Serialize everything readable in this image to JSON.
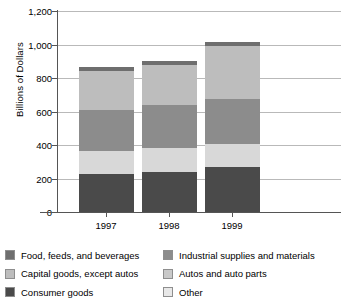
{
  "chart_data": {
    "type": "bar",
    "subtype": "stacked-vertical",
    "title": "",
    "xlabel": "",
    "ylabel": "Billions of Dollars",
    "categories": [
      "1997",
      "1998",
      "1999"
    ],
    "ylim": [
      0,
      1200
    ],
    "yticks": [
      0,
      200,
      400,
      600,
      800,
      1000,
      1200
    ],
    "ytick_labels": [
      "0",
      "200",
      "400",
      "600",
      "800",
      "1,000",
      "1,200"
    ],
    "grid": true,
    "legend_position": "bottom",
    "stack_order_bottom_to_top": [
      "Consumer goods",
      "Other",
      "Industrial supplies and materials",
      "Autos and auto parts",
      "Capital goods, except autos",
      "Food, feeds, and beverages"
    ],
    "series": [
      {
        "name": "Consumer goods",
        "color": "#4a4a4a",
        "values": [
          226,
          241,
          267
        ]
      },
      {
        "name": "Other",
        "color": "#d8d8d8",
        "values": [
          137,
          140,
          138
        ]
      },
      {
        "name": "Industrial supplies and materials",
        "color": "#8c8c8c",
        "values": [
          247,
          255,
          270
        ]
      },
      {
        "name": "Autos and auto parts",
        "color": "#c9c9c9",
        "values": [
          0,
          0,
          0
        ]
      },
      {
        "name": "Capital goods, except autos",
        "color": "#bdbdbd",
        "values": [
          233,
          243,
          315
        ]
      },
      {
        "name": "Food, feeds, and beverages",
        "color": "#6e6e6e",
        "values": [
          22,
          21,
          25
        ]
      }
    ],
    "totals": [
      865,
      900,
      1015
    ]
  },
  "legend": {
    "column1": [
      {
        "label": "Food, feeds, and beverages",
        "color": "#6e6e6e"
      },
      {
        "label": "Capital goods, except autos",
        "color": "#bdbdbd"
      },
      {
        "label": "Consumer goods",
        "color": "#4a4a4a"
      }
    ],
    "column2": [
      {
        "label": "Industrial supplies and materials",
        "color": "#8c8c8c"
      },
      {
        "label": "Autos and auto parts",
        "color": "#c9c9c9"
      },
      {
        "label": "Other",
        "color": "#e8e8e8"
      }
    ]
  }
}
